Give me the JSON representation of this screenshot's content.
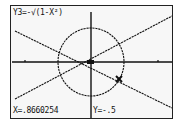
{
  "calculator": {
    "equation_label": "Y3=-√(1-X²)",
    "trace": {
      "x_label": "X=.8660254",
      "y_label": "Y=-.5",
      "x": 0.8660254,
      "y": -0.5
    },
    "graph": {
      "colors": {
        "background": "#f7f7f7",
        "ink": "#111111"
      },
      "axes": {
        "origin_px": [
          91,
          62
        ]
      },
      "circle": {
        "cx": 91,
        "cy": 62,
        "rx": 33,
        "ry": 34
      },
      "lines": [
        {
          "x1": 15,
          "y1": 31,
          "x2": 172,
          "y2": 108
        },
        {
          "x1": 15,
          "y1": 99,
          "x2": 172,
          "y2": 16
        }
      ],
      "ticks_x": [
        25,
        158
      ],
      "cursor_px": [
        119,
        79
      ]
    }
  }
}
